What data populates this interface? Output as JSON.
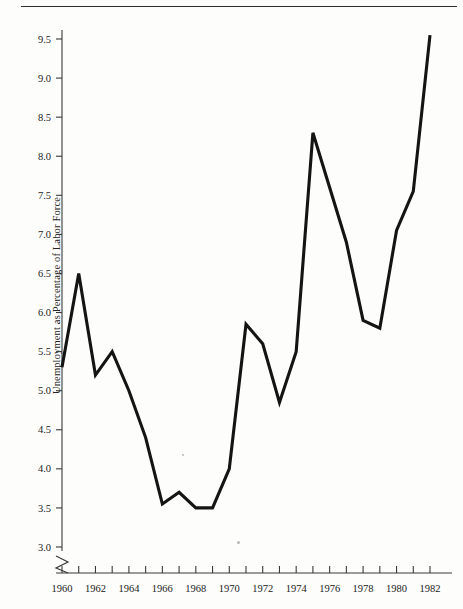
{
  "figure": {
    "has_top_rule": true,
    "background_color": "#fdfdfc",
    "line_color": "#141414",
    "axis_color": "#3a3a3a"
  },
  "chart_data": {
    "type": "line",
    "title": "",
    "xlabel": "",
    "ylabel": "Unemployment as Percentage of Labor Force",
    "x": [
      1960,
      1961,
      1962,
      1963,
      1964,
      1965,
      1966,
      1967,
      1968,
      1969,
      1970,
      1971,
      1972,
      1973,
      1974,
      1975,
      1976,
      1977,
      1978,
      1979,
      1980,
      1981,
      1982
    ],
    "values": [
      5.3,
      6.5,
      5.2,
      5.5,
      5.0,
      4.4,
      3.55,
      3.7,
      3.5,
      3.5,
      4.0,
      5.85,
      5.6,
      4.85,
      5.5,
      8.3,
      7.6,
      6.9,
      5.9,
      5.8,
      7.05,
      7.55,
      9.55
    ],
    "series": [
      {
        "name": "Unemployment Rate",
        "values": [
          5.3,
          6.5,
          5.2,
          5.5,
          5.0,
          4.4,
          3.55,
          3.7,
          3.5,
          3.5,
          4.0,
          5.85,
          5.6,
          4.85,
          5.5,
          8.3,
          7.6,
          6.9,
          5.9,
          5.8,
          7.05,
          7.55,
          9.55
        ]
      }
    ],
    "ylim": [
      3.0,
      9.5
    ],
    "xlim": [
      1960,
      1982
    ],
    "y_ticks": [
      "3.0",
      "3.5",
      "4.0",
      "4.5",
      "5.0",
      "5.5",
      "6.0",
      "6.5",
      "7.0",
      "7.5",
      "8.0",
      "8.5",
      "9.0",
      "9.5"
    ],
    "y_tick_values": [
      3.0,
      3.5,
      4.0,
      4.5,
      5.0,
      5.5,
      6.0,
      6.5,
      7.0,
      7.5,
      8.0,
      8.5,
      9.0,
      9.5
    ],
    "x_tick_labels": [
      "1960",
      "1962",
      "1964",
      "1966",
      "1968",
      "1970",
      "1972",
      "1974",
      "1976",
      "1978",
      "1980",
      "1982"
    ],
    "x_tick_label_values": [
      1960,
      1962,
      1964,
      1966,
      1968,
      1970,
      1972,
      1974,
      1976,
      1978,
      1980,
      1982
    ],
    "x_minor_ticks": [
      1960,
      1961,
      1962,
      1963,
      1964,
      1965,
      1966,
      1967,
      1968,
      1969,
      1970,
      1971,
      1972,
      1973,
      1974,
      1975,
      1976,
      1977,
      1978,
      1979,
      1980,
      1981,
      1982
    ],
    "grid": false,
    "legend": "none",
    "y_axis_break": true
  }
}
